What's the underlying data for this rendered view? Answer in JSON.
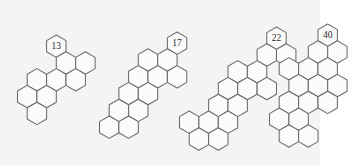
{
  "figure": {
    "background_color": "#f4f4f2",
    "stroke_color": "#6b6b6b",
    "fill_color": "#fbfbfa",
    "label_color": "#2a2a2a",
    "caption": "",
    "structure_count": 4
  },
  "structures": [
    {
      "name": "structure-13",
      "label": "13",
      "label_cell": [
        0,
        2
      ],
      "origin_x": 14,
      "origin_y": 33,
      "hex_radius": 11.2,
      "cells": [
        [
          0,
          2
        ],
        [
          0,
          1
        ],
        [
          1,
          1
        ],
        [
          -1,
          0
        ],
        [
          0,
          0
        ],
        [
          1,
          0
        ],
        [
          -1,
          -1
        ],
        [
          0,
          -1
        ],
        [
          -1,
          -2
        ]
      ]
    },
    {
      "name": "structure-17",
      "label": "17",
      "label_cell": [
        1,
        3
      ],
      "origin_x": 96,
      "origin_y": 30,
      "hex_radius": 11.2,
      "cells": [
        [
          1,
          3
        ],
        [
          0,
          2
        ],
        [
          1,
          2
        ],
        [
          -1,
          1
        ],
        [
          0,
          1
        ],
        [
          1,
          1
        ],
        [
          -1,
          0
        ],
        [
          0,
          0
        ],
        [
          -1,
          -1
        ],
        [
          0,
          -1
        ],
        [
          -2,
          -2
        ],
        [
          -1,
          -2
        ]
      ]
    },
    {
      "name": "structure-22",
      "label": "22",
      "label_cell": [
        2,
        4
      ],
      "origin_x": 176,
      "origin_y": 25,
      "hex_radius": 11.2,
      "cells": [
        [
          2,
          4
        ],
        [
          1,
          3
        ],
        [
          2,
          3
        ],
        [
          0,
          2
        ],
        [
          1,
          2
        ],
        [
          -1,
          1
        ],
        [
          0,
          1
        ],
        [
          1,
          1
        ],
        [
          -1,
          0
        ],
        [
          0,
          0
        ],
        [
          -2,
          -1
        ],
        [
          -1,
          -1
        ],
        [
          0,
          -1
        ],
        [
          -2,
          -2
        ],
        [
          -1,
          -2
        ]
      ]
    },
    {
      "name": "structure-40",
      "label": "40",
      "label_cell": [
        1,
        4
      ],
      "origin_x": 266,
      "origin_y": 22,
      "hex_radius": 11.2,
      "cells": [
        [
          1,
          4
        ],
        [
          0,
          3
        ],
        [
          1,
          3
        ],
        [
          -1,
          2
        ],
        [
          0,
          2
        ],
        [
          1,
          2
        ],
        [
          -1,
          1
        ],
        [
          0,
          1
        ],
        [
          1,
          1
        ],
        [
          -1,
          0
        ],
        [
          0,
          0
        ],
        [
          1,
          0
        ],
        [
          -1,
          -1
        ],
        [
          0,
          -1
        ],
        [
          -1,
          -2
        ],
        [
          0,
          -2
        ]
      ]
    }
  ]
}
